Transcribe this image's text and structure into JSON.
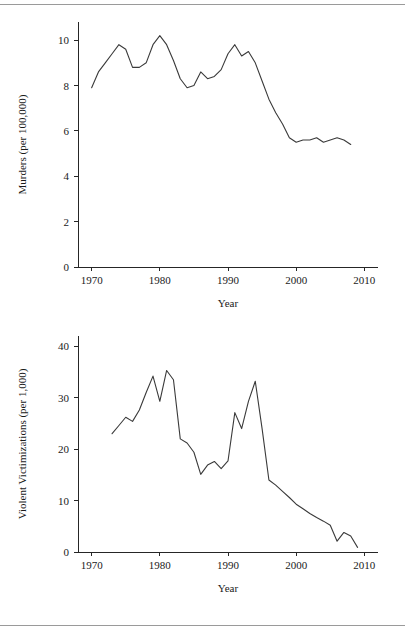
{
  "document": {
    "rule_top": true,
    "rule_bottom": true
  },
  "chart_data": [
    {
      "id": "murders",
      "type": "line",
      "title": "",
      "xlabel": "Year",
      "ylabel": "Murders (per 100,000)",
      "xlim": [
        1968,
        2012
      ],
      "ylim": [
        0,
        10.8
      ],
      "xticks": [
        1970,
        1980,
        1990,
        2000,
        2010
      ],
      "xtick_labels": [
        "1970",
        "1980",
        "1990",
        "2000",
        "2010"
      ],
      "yticks": [
        0,
        2,
        4,
        6,
        8,
        10
      ],
      "ytick_labels": [
        "0",
        "2",
        "4",
        "6",
        "8",
        "10"
      ],
      "grid": false,
      "legend": null,
      "line_color": "#3a3a3a",
      "x": [
        1970,
        1971,
        1972,
        1973,
        1974,
        1975,
        1976,
        1977,
        1978,
        1979,
        1980,
        1981,
        1982,
        1983,
        1984,
        1985,
        1986,
        1987,
        1988,
        1989,
        1990,
        1991,
        1992,
        1993,
        1994,
        1995,
        1996,
        1997,
        1998,
        1999,
        2000,
        2001,
        2002,
        2003,
        2004,
        2005,
        2006,
        2007,
        2008
      ],
      "values": [
        7.9,
        8.6,
        9.0,
        9.4,
        9.8,
        9.6,
        8.8,
        8.8,
        9.0,
        9.8,
        10.2,
        9.8,
        9.1,
        8.3,
        7.9,
        8.0,
        8.6,
        8.3,
        8.4,
        8.7,
        9.4,
        9.8,
        9.3,
        9.5,
        9.0,
        8.2,
        7.4,
        6.8,
        6.3,
        5.7,
        5.5,
        5.6,
        5.6,
        5.7,
        5.5,
        5.6,
        5.7,
        5.6,
        5.4
      ]
    },
    {
      "id": "victimizations",
      "type": "line",
      "title": "",
      "xlabel": "Year",
      "ylabel": "Violent Victimizations (per 1,000)",
      "xlim": [
        1968,
        2012
      ],
      "ylim": [
        0,
        42
      ],
      "xticks": [
        1970,
        1980,
        1990,
        2000,
        2010
      ],
      "xtick_labels": [
        "1970",
        "1980",
        "1990",
        "2000",
        "2010"
      ],
      "yticks": [
        0,
        10,
        20,
        30,
        40
      ],
      "ytick_labels": [
        "0",
        "10",
        "20",
        "30",
        "40"
      ],
      "grid": false,
      "legend": null,
      "line_color": "#3a3a3a",
      "x": [
        1973,
        1974,
        1975,
        1976,
        1977,
        1978,
        1979,
        1980,
        1981,
        1982,
        1983,
        1984,
        1985,
        1986,
        1987,
        1988,
        1989,
        1990,
        1991,
        1992,
        1993,
        1994,
        1995,
        1996,
        1997,
        1998,
        1999,
        2000,
        2001,
        2002,
        2003,
        2004,
        2005,
        2006,
        2007,
        2008,
        2009
      ],
      "values": [
        23.0,
        24.6,
        26.2,
        25.4,
        27.6,
        31.0,
        34.2,
        29.3,
        35.3,
        33.5,
        22.0,
        21.2,
        19.4,
        15.1,
        16.9,
        17.6,
        16.2,
        17.7,
        27.1,
        24.0,
        29.3,
        33.2,
        24.0,
        14.0,
        13.0,
        11.8,
        10.6,
        9.3,
        8.4,
        7.5,
        6.7,
        6.0,
        5.2,
        2.1,
        3.8,
        3.1,
        0.9
      ]
    }
  ]
}
